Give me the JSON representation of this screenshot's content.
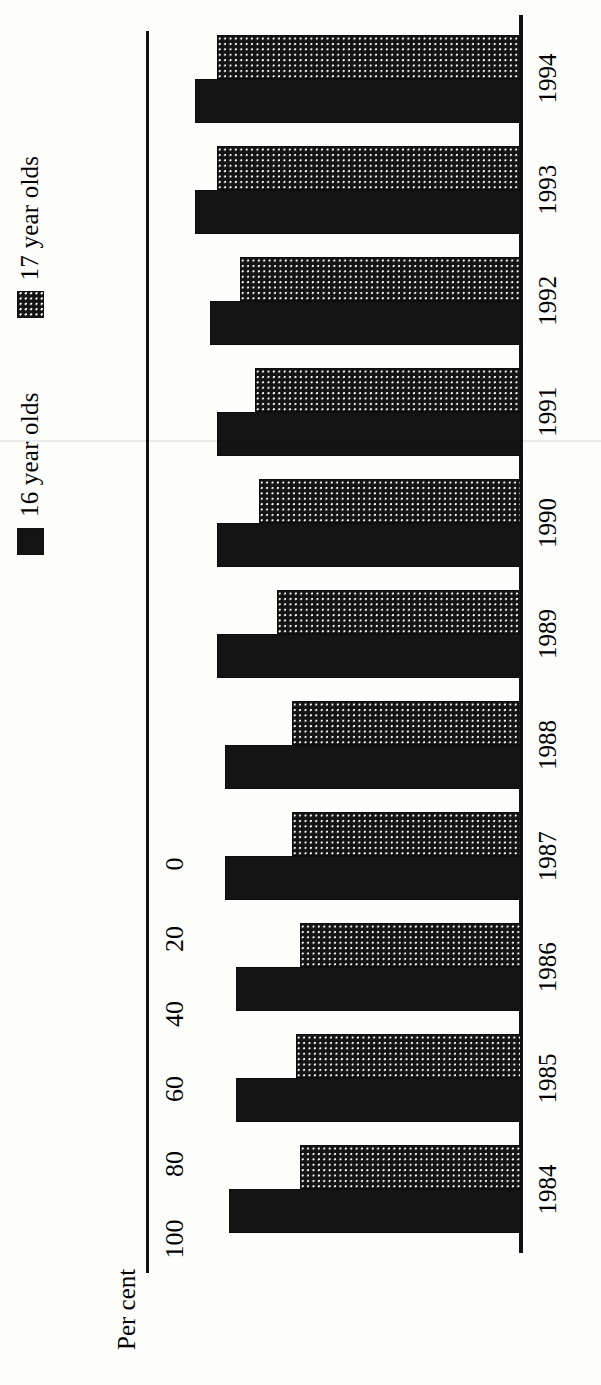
{
  "chart_data": {
    "type": "bar",
    "title": "",
    "subtitle": "",
    "orientation": "vertical-bars-rotated-90ccw",
    "xlabel": "",
    "ylabel": "Per cent",
    "categories": [
      "1984",
      "1985",
      "1986",
      "1987",
      "1988",
      "1989",
      "1990",
      "1991",
      "1992",
      "1993",
      "1994"
    ],
    "series": [
      {
        "name": "16 year olds",
        "fill": "solid-black",
        "color": "#141414",
        "values": [
          78,
          76,
          76,
          79,
          79,
          81,
          81,
          81,
          83,
          87,
          87
        ]
      },
      {
        "name": "17 year olds",
        "fill": "stipple-dotted",
        "color": "#141414",
        "values": [
          59,
          60,
          59,
          61,
          61,
          65,
          70,
          71,
          75,
          81,
          81
        ]
      }
    ],
    "ylim": [
      0,
      100
    ],
    "yticks": [
      0,
      20,
      40,
      60,
      80,
      100
    ],
    "ytick_labels": [
      "0",
      "20",
      "40",
      "60",
      "80",
      "100"
    ],
    "grid": false,
    "legend_position": "top-left"
  },
  "axis": {
    "value_axis_title": "Per cent",
    "tick_labels": [
      "0",
      "20",
      "40",
      "60",
      "80",
      "100"
    ],
    "category_labels": [
      "1984",
      "1985",
      "1986",
      "1987",
      "1988",
      "1989",
      "1990",
      "1991",
      "1992",
      "1993",
      "1994"
    ]
  },
  "legend": {
    "items": [
      {
        "label": "16 year olds",
        "style": "solid"
      },
      {
        "label": "17 year olds",
        "style": "stipple"
      }
    ]
  },
  "colors": {
    "ink": "#141414",
    "paper": "#fdfdfc"
  }
}
